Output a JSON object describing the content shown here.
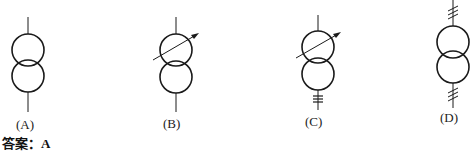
{
  "figure": {
    "type": "transformer-symbol-options",
    "options": [
      {
        "label": "(A)",
        "symbol": "two-winding-transformer",
        "arrow": false,
        "top_marks": 0,
        "bottom_marks": 0
      },
      {
        "label": "(B)",
        "symbol": "two-winding-transformer-adjustable",
        "arrow": true,
        "top_marks": 0,
        "bottom_marks": 0
      },
      {
        "label": "(C)",
        "symbol": "two-winding-transformer-adjustable",
        "arrow": true,
        "top_marks": 0,
        "bottom_marks": 3
      },
      {
        "label": "(D)",
        "symbol": "two-winding-transformer-three-phase",
        "arrow": false,
        "top_marks": 3,
        "bottom_marks": 3
      }
    ],
    "stroke_color": "#1a1a1a"
  },
  "answer": {
    "prefix": "答案：",
    "value": "A"
  }
}
